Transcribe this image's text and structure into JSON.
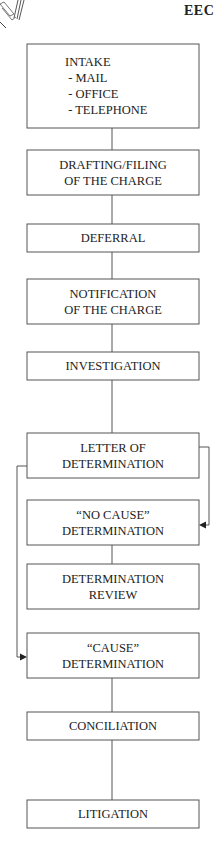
{
  "header": {
    "title": "EEC"
  },
  "logo": {
    "icon": "document-stack-icon"
  },
  "flowchart": {
    "stroke_color": "#555555",
    "boxes": [
      {
        "id": "intake",
        "lines": [
          "INTAKE",
          " - MAIL",
          " - OFFICE",
          " - TELEPHONE"
        ],
        "align": "left"
      },
      {
        "id": "drafting",
        "lines": [
          "DRAFTING/FILING",
          "OF THE CHARGE"
        ]
      },
      {
        "id": "deferral",
        "lines": [
          "DEFERRAL"
        ]
      },
      {
        "id": "notification",
        "lines": [
          "NOTIFICATION",
          "OF THE CHARGE"
        ]
      },
      {
        "id": "investigation",
        "lines": [
          "INVESTIGATION"
        ]
      },
      {
        "id": "letter",
        "lines": [
          "LETTER OF",
          "DETERMINATION"
        ]
      },
      {
        "id": "no-cause",
        "lines": [
          "“NO CAUSE”",
          "DETERMINATION"
        ]
      },
      {
        "id": "review",
        "lines": [
          "DETERMINATION",
          "REVIEW"
        ]
      },
      {
        "id": "cause",
        "lines": [
          "“CAUSE”",
          "DETERMINATION"
        ]
      },
      {
        "id": "conciliation",
        "lines": [
          "CONCILIATION"
        ]
      },
      {
        "id": "litigation",
        "lines": [
          "LITIGATION"
        ]
      }
    ],
    "connectors": [
      {
        "from": "intake",
        "to": "drafting",
        "type": "line"
      },
      {
        "from": "drafting",
        "to": "deferral",
        "type": "line"
      },
      {
        "from": "deferral",
        "to": "notification",
        "type": "line"
      },
      {
        "from": "notification",
        "to": "investigation",
        "type": "line"
      },
      {
        "from": "investigation",
        "to": "letter",
        "type": "line"
      },
      {
        "from": "letter",
        "to": "no-cause",
        "type": "side-arrow-right"
      },
      {
        "from": "no-cause",
        "to": "review",
        "type": "line"
      },
      {
        "from": "letter",
        "to": "cause",
        "type": "side-arrow-left"
      },
      {
        "from": "cause",
        "to": "conciliation",
        "type": "line"
      },
      {
        "from": "conciliation",
        "to": "litigation",
        "type": "line"
      }
    ]
  }
}
